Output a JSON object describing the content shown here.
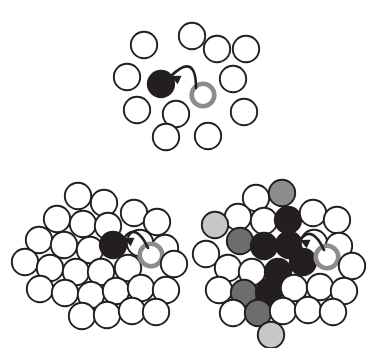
{
  "figure": {
    "width": 383,
    "height": 348,
    "background": "#ffffff",
    "type": "diagram",
    "colors": {
      "outline": "#231f20",
      "empty_fill": "#ffffff",
      "dark_fill": "#231f20",
      "mid_dark_fill": "#3c3a3b",
      "mid_fill": "#6e6c6d",
      "mid_light_fill": "#8d8b8c",
      "light_fill": "#c9c7c5",
      "very_light_fill": "#ddd9d4",
      "ring_stroke": "#8d8b8c",
      "arrow_stroke": "#231f20"
    },
    "geometry": {
      "circle_radius": 13.2,
      "outline_width": 1.9,
      "ring_width": 4.6
    }
  },
  "panels": [
    {
      "id": "panel-top",
      "name": "sparse-lattice-panel",
      "label": "",
      "circles": [
        {
          "cx": 192,
          "cy": 36,
          "shade": "empty"
        },
        {
          "cx": 144,
          "cy": 45,
          "shade": "empty"
        },
        {
          "cx": 217,
          "cy": 49,
          "shade": "empty"
        },
        {
          "cx": 246,
          "cy": 49,
          "shade": "empty"
        },
        {
          "cx": 127,
          "cy": 77,
          "shade": "empty"
        },
        {
          "cx": 161,
          "cy": 84,
          "shade": "dark"
        },
        {
          "cx": 233,
          "cy": 79,
          "shade": "empty"
        },
        {
          "cx": 137,
          "cy": 110,
          "shade": "empty"
        },
        {
          "cx": 176,
          "cy": 114,
          "shade": "empty"
        },
        {
          "cx": 203,
          "cy": 95,
          "shade": "ring"
        },
        {
          "cx": 244,
          "cy": 112,
          "shade": "empty"
        },
        {
          "cx": 166,
          "cy": 137,
          "shade": "empty"
        },
        {
          "cx": 208,
          "cy": 136,
          "shade": "empty"
        }
      ],
      "arrow": {
        "from_x": 196,
        "from_y": 88,
        "to_x": 171,
        "to_y": 76,
        "curve_cx": 196,
        "curve_cy": 52,
        "head_angle": 205
      }
    },
    {
      "id": "panel-bottom-left",
      "name": "dense-lattice-panel",
      "label": "",
      "circles": [
        {
          "cx": 78,
          "cy": 196,
          "shade": "empty"
        },
        {
          "cx": 104,
          "cy": 203,
          "shade": "empty"
        },
        {
          "cx": 57,
          "cy": 219,
          "shade": "empty"
        },
        {
          "cx": 83,
          "cy": 224,
          "shade": "empty"
        },
        {
          "cx": 108,
          "cy": 226,
          "shade": "empty"
        },
        {
          "cx": 134,
          "cy": 213,
          "shade": "empty"
        },
        {
          "cx": 157,
          "cy": 222,
          "shade": "empty"
        },
        {
          "cx": 39,
          "cy": 240,
          "shade": "empty"
        },
        {
          "cx": 64,
          "cy": 245,
          "shade": "empty"
        },
        {
          "cx": 90,
          "cy": 250,
          "shade": "empty"
        },
        {
          "cx": 113,
          "cy": 245,
          "shade": "dark"
        },
        {
          "cx": 140,
          "cy": 243,
          "shade": "empty"
        },
        {
          "cx": 165,
          "cy": 248,
          "shade": "empty"
        },
        {
          "cx": 25,
          "cy": 262,
          "shade": "empty"
        },
        {
          "cx": 50,
          "cy": 268,
          "shade": "empty"
        },
        {
          "cx": 76,
          "cy": 272,
          "shade": "empty"
        },
        {
          "cx": 101,
          "cy": 272,
          "shade": "empty"
        },
        {
          "cx": 128,
          "cy": 268,
          "shade": "empty"
        },
        {
          "cx": 151,
          "cy": 255,
          "shade": "ring"
        },
        {
          "cx": 174,
          "cy": 264,
          "shade": "empty"
        },
        {
          "cx": 40,
          "cy": 289,
          "shade": "empty"
        },
        {
          "cx": 65,
          "cy": 293,
          "shade": "empty"
        },
        {
          "cx": 91,
          "cy": 295,
          "shade": "empty"
        },
        {
          "cx": 116,
          "cy": 291,
          "shade": "empty"
        },
        {
          "cx": 141,
          "cy": 288,
          "shade": "empty"
        },
        {
          "cx": 166,
          "cy": 290,
          "shade": "empty"
        },
        {
          "cx": 82,
          "cy": 316,
          "shade": "empty"
        },
        {
          "cx": 107,
          "cy": 315,
          "shade": "empty"
        },
        {
          "cx": 132,
          "cy": 311,
          "shade": "empty"
        },
        {
          "cx": 156,
          "cy": 312,
          "shade": "empty"
        }
      ],
      "arrow": {
        "from_x": 148,
        "from_y": 248,
        "to_x": 124,
        "to_y": 238,
        "curve_cx": 136,
        "curve_cy": 222,
        "head_angle": 205
      }
    },
    {
      "id": "panel-bottom-right",
      "name": "gradient-lattice-panel",
      "label": "",
      "circles": [
        {
          "cx": 256,
          "cy": 198,
          "shade": "empty"
        },
        {
          "cx": 282,
          "cy": 193,
          "shade": "mid_light"
        },
        {
          "cx": 238,
          "cy": 217,
          "shade": "empty"
        },
        {
          "cx": 264,
          "cy": 221,
          "shade": "empty"
        },
        {
          "cx": 288,
          "cy": 220,
          "shade": "dark"
        },
        {
          "cx": 313,
          "cy": 213,
          "shade": "empty"
        },
        {
          "cx": 337,
          "cy": 220,
          "shade": "empty"
        },
        {
          "cx": 215,
          "cy": 225,
          "shade": "light"
        },
        {
          "cx": 240,
          "cy": 241,
          "shade": "mid"
        },
        {
          "cx": 264,
          "cy": 246,
          "shade": "dark"
        },
        {
          "cx": 289,
          "cy": 245,
          "shade": "dark"
        },
        {
          "cx": 314,
          "cy": 243,
          "shade": "empty"
        },
        {
          "cx": 339,
          "cy": 246,
          "shade": "empty"
        },
        {
          "cx": 206,
          "cy": 254,
          "shade": "empty"
        },
        {
          "cx": 228,
          "cy": 268,
          "shade": "empty"
        },
        {
          "cx": 252,
          "cy": 272,
          "shade": "empty"
        },
        {
          "cx": 278,
          "cy": 272,
          "shade": "dark"
        },
        {
          "cx": 303,
          "cy": 262,
          "shade": "dark"
        },
        {
          "cx": 327,
          "cy": 257,
          "shade": "ring"
        },
        {
          "cx": 352,
          "cy": 266,
          "shade": "empty"
        },
        {
          "cx": 219,
          "cy": 290,
          "shade": "empty"
        },
        {
          "cx": 244,
          "cy": 293,
          "shade": "mid"
        },
        {
          "cx": 269,
          "cy": 292,
          "shade": "dark"
        },
        {
          "cx": 294,
          "cy": 288,
          "shade": "empty"
        },
        {
          "cx": 320,
          "cy": 287,
          "shade": "empty"
        },
        {
          "cx": 344,
          "cy": 291,
          "shade": "empty"
        },
        {
          "cx": 233,
          "cy": 313,
          "shade": "empty"
        },
        {
          "cx": 258,
          "cy": 313,
          "shade": "mid"
        },
        {
          "cx": 283,
          "cy": 311,
          "shade": "empty"
        },
        {
          "cx": 308,
          "cy": 310,
          "shade": "empty"
        },
        {
          "cx": 333,
          "cy": 312,
          "shade": "empty"
        },
        {
          "cx": 271,
          "cy": 335,
          "shade": "light"
        }
      ],
      "arrow": {
        "from_x": 324,
        "from_y": 250,
        "to_x": 300,
        "to_y": 240,
        "curve_cx": 312,
        "curve_cy": 224,
        "head_angle": 205
      }
    }
  ]
}
